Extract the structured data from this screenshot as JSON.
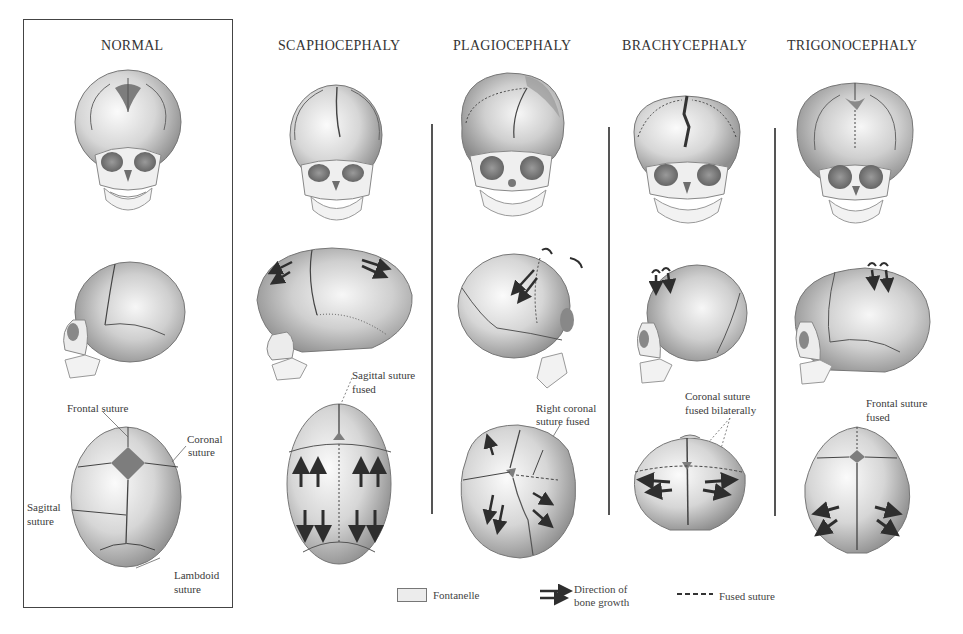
{
  "diagram": {
    "columns": [
      {
        "id": "normal",
        "title": "NORMAL",
        "labels": [
          "Frontal suture",
          "Coronal",
          "suture",
          "Sagittal",
          "suture",
          "Lambdoid",
          "suture"
        ]
      },
      {
        "id": "scaphocephaly",
        "title": "SCAPHOCEPHALY",
        "labels": [
          "Sagittal suture",
          "fused"
        ]
      },
      {
        "id": "plagiocephaly",
        "title": "PLAGIOCEPHALY",
        "labels": [
          "Right coronal",
          "suture fused"
        ]
      },
      {
        "id": "brachycephaly",
        "title": "BRACHYCEPHALY",
        "labels": [
          "Coronal suture",
          "fused bilaterally"
        ]
      },
      {
        "id": "trigonocephaly",
        "title": "TRIGONOCEPHALY",
        "labels": [
          "Frontal suture",
          "fused"
        ]
      }
    ],
    "legend": {
      "fontanelle": "Fontanelle",
      "growth_line1": "Direction of",
      "growth_line2": "bone growth",
      "fused": "Fused suture"
    },
    "colors": {
      "bone_light": "#f2f2f2",
      "bone_mid": "#bdbdbd",
      "bone_dark": "#7a7a7a",
      "suture": "#444444",
      "fontanelle": "#8a8a8a",
      "arrow": "#2e2e2e",
      "line": "#555555"
    }
  }
}
